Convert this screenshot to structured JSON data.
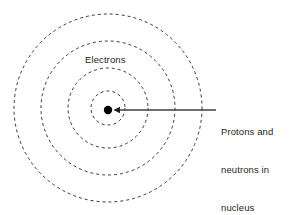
{
  "diagram": {
    "type": "bohr-atom-model",
    "background_color": "#ffffff",
    "stroke_color": "#231f20",
    "text_color": "#231f20",
    "canvas": {
      "width": 289,
      "height": 215
    },
    "center": {
      "x": 108,
      "y": 108
    },
    "nucleus": {
      "label_lines": [
        "Protons and",
        "neutrons in",
        "nucleus"
      ],
      "dot_radius": 4.2,
      "fill_color": "#000000"
    },
    "shells": [
      {
        "name": "shell-1",
        "radius": 17
      },
      {
        "name": "shell-2",
        "radius": 40
      },
      {
        "name": "shell-3",
        "radius": 67
      },
      {
        "name": "shell-4",
        "radius": 94
      }
    ],
    "shell_style": {
      "dash": "3 3",
      "stroke_width": 0.9,
      "fill": "none"
    },
    "electrons_label": "Electrons",
    "leader_line": {
      "from_x": 216,
      "to_x": 114,
      "y": 110,
      "arrowhead": "left"
    }
  }
}
